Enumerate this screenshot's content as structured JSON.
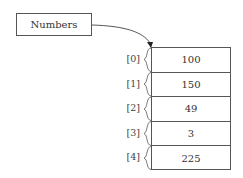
{
  "variable": {
    "name": "Numbers"
  },
  "array": {
    "cells": [
      {
        "index": "[0]",
        "value": "100"
      },
      {
        "index": "[1]",
        "value": "150"
      },
      {
        "index": "[2]",
        "value": "49"
      },
      {
        "index": "[3]",
        "value": "3"
      },
      {
        "index": "[4]",
        "value": "225"
      }
    ]
  },
  "colors": {
    "stroke": "#555555",
    "text": "#333333"
  }
}
